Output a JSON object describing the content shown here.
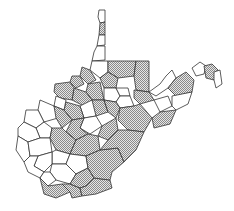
{
  "map": {
    "region": "West Virginia",
    "subdivision": "counties",
    "legend": {
      "shaded": {
        "fill": "#c8c8c8",
        "pattern": "stipple"
      },
      "unshaded": {
        "fill": "#ffffff"
      }
    },
    "stroke_color": "#333333"
  },
  "caption": {
    "text": "",
    "note": "caption text truncated at bottom edge"
  }
}
